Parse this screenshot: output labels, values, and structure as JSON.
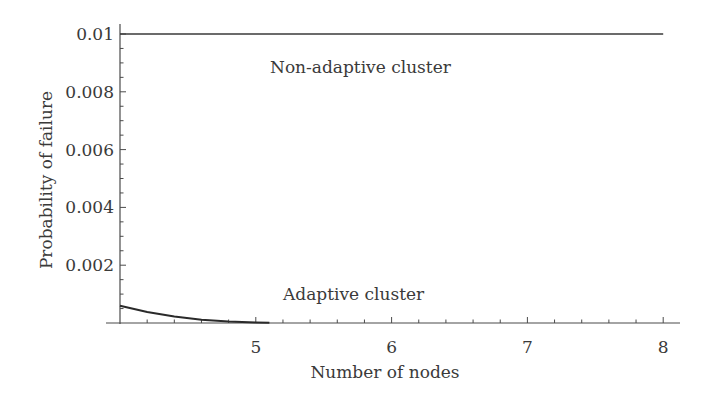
{
  "chart_data": {
    "type": "line",
    "title": "",
    "xlabel": "Number of nodes",
    "ylabel": "Probability of failure",
    "xlim": [
      4,
      8.2
    ],
    "ylim": [
      0,
      0.01
    ],
    "x_ticks": [
      5,
      6,
      7,
      8
    ],
    "x_tick_labels": [
      "5",
      "6",
      "7",
      "8"
    ],
    "y_ticks": [
      0.002,
      0.004,
      0.006,
      0.008,
      0.01
    ],
    "y_tick_labels": [
      "0.002",
      "0.004",
      "0.006",
      "0.008",
      "0.01"
    ],
    "grid": false,
    "legend": "none (inline annotations)",
    "series": [
      {
        "name": "Non-adaptive cluster",
        "x": [
          4,
          5,
          6,
          7,
          8
        ],
        "values": [
          0.01,
          0.01,
          0.01,
          0.01,
          0.01
        ]
      },
      {
        "name": "Adaptive cluster",
        "x": [
          4,
          4.2,
          4.4,
          4.6,
          4.8,
          5.0,
          5.1
        ],
        "values": [
          0.0006,
          0.00038,
          0.00022,
          0.00011,
          5e-05,
          2e-05,
          1e-05
        ]
      }
    ],
    "annotations": [
      {
        "text": "Non-adaptive cluster",
        "x": 5.3,
        "y": 0.0089
      },
      {
        "text": "Adaptive cluster",
        "x": 5.3,
        "y": 0.0011
      }
    ]
  }
}
